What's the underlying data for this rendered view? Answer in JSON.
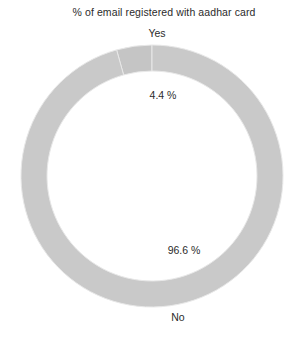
{
  "chart_data": {
    "type": "pie",
    "variant": "donut",
    "title": "% of email registered with aadhar card",
    "xlabel": "",
    "ylabel": "",
    "categories": [
      "Yes",
      "No"
    ],
    "values": [
      4.4,
      96.6
    ],
    "value_labels": [
      "4.4 %",
      "96.6 %"
    ],
    "category_labels": [
      "Yes",
      "No"
    ],
    "units": "%",
    "legend": "none",
    "grid": false,
    "colors": [
      "#c5c5c5",
      "#c9c9c9"
    ],
    "slice_border_color": "#e8e8e8",
    "background": "#ffffff",
    "text_color": "#2b2b2b",
    "geometry": {
      "center_x": 152,
      "center_y": 176,
      "outer_radius": 131,
      "inner_radius": 105,
      "start_angle_deg": -90
    },
    "annotations": [
      {
        "text": "Yes",
        "kind": "category",
        "x": 140,
        "y": 36
      },
      {
        "text": "4.4 %",
        "kind": "value",
        "x": 154,
        "y": 96
      },
      {
        "text": "96.6 %",
        "kind": "value",
        "x": 175,
        "y": 251
      },
      {
        "text": "No",
        "kind": "category",
        "x": 178,
        "y": 319
      }
    ]
  }
}
